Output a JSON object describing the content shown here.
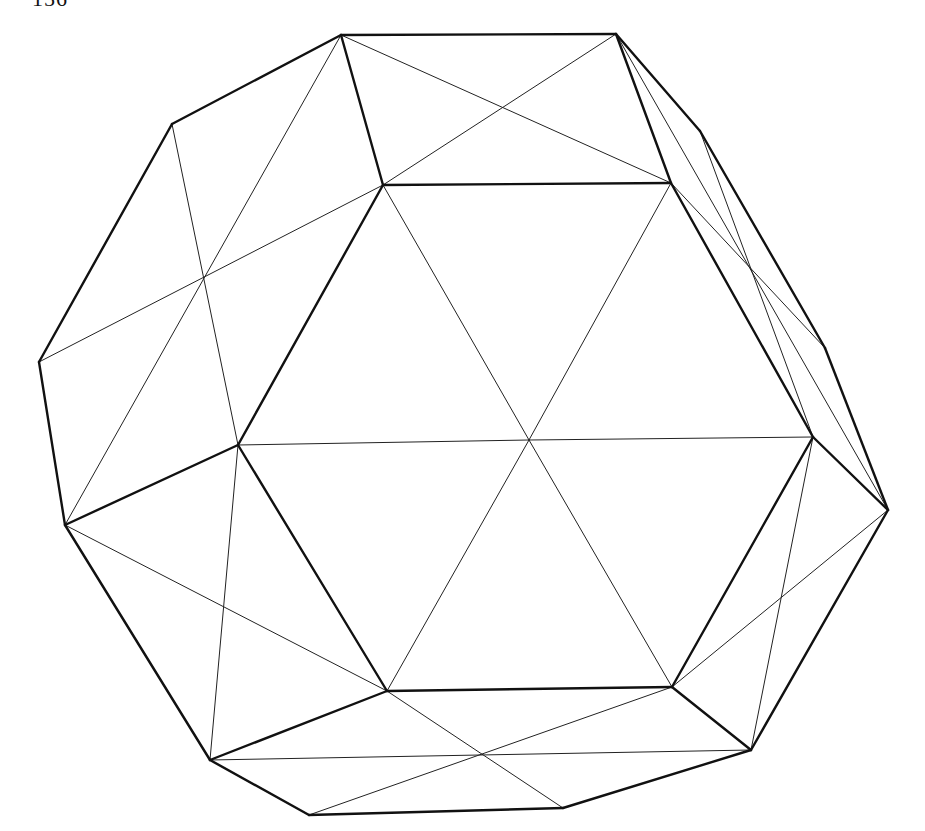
{
  "page": {
    "number": "156"
  },
  "figure": {
    "stroke_color": "#111111",
    "background": "#ffffff",
    "vertices": {
      "T1": [
        341,
        35
      ],
      "T2": [
        616,
        34
      ],
      "HTL": [
        383,
        185
      ],
      "HTR": [
        671,
        183
      ],
      "HR": [
        813,
        437
      ],
      "HBR": [
        672,
        687
      ],
      "HBL": [
        387,
        691
      ],
      "HL": [
        238,
        445
      ],
      "C": [
        529,
        440
      ],
      "O1": [
        172,
        124
      ],
      "X1": [
        203,
        279
      ],
      "O2": [
        39,
        362
      ],
      "O3": [
        65,
        525
      ],
      "R1": [
        700,
        131
      ],
      "R2": [
        750,
        267
      ],
      "R4": [
        825,
        348
      ],
      "R5": [
        888,
        510
      ],
      "B1": [
        210,
        760
      ],
      "B2": [
        481,
        755
      ],
      "B3": [
        309,
        815
      ],
      "B4": [
        563,
        808
      ],
      "B5": [
        751,
        750
      ]
    },
    "thick_edges": [
      [
        "T1",
        "T2"
      ],
      [
        "T1",
        "HTL"
      ],
      [
        "T2",
        "HTR"
      ],
      [
        "HTL",
        "HTR"
      ],
      [
        "HTR",
        "HR"
      ],
      [
        "HR",
        "HBR"
      ],
      [
        "HBR",
        "HBL"
      ],
      [
        "HBL",
        "HL"
      ],
      [
        "HL",
        "HTL"
      ],
      [
        "T1",
        "O1"
      ],
      [
        "O1",
        "O2"
      ],
      [
        "O2",
        "O3"
      ],
      [
        "O3",
        "HL"
      ],
      [
        "O3",
        "B1"
      ],
      [
        "B1",
        "HBL"
      ],
      [
        "B1",
        "B3"
      ],
      [
        "B3",
        "B4"
      ],
      [
        "B4",
        "B5"
      ],
      [
        "B5",
        "HBR"
      ],
      [
        "B5",
        "R5"
      ],
      [
        "R5",
        "HR"
      ],
      [
        "R5",
        "R4"
      ],
      [
        "R4",
        "R1"
      ],
      [
        "R1",
        "T2"
      ]
    ],
    "thin_edges": [
      [
        "C",
        "HTL"
      ],
      [
        "C",
        "HTR"
      ],
      [
        "C",
        "HR"
      ],
      [
        "C",
        "HBR"
      ],
      [
        "C",
        "HBL"
      ],
      [
        "C",
        "HL"
      ],
      [
        "T1",
        "HTR"
      ],
      [
        "T2",
        "HTL"
      ],
      [
        "T1",
        "O3"
      ],
      [
        "O1",
        "HL"
      ],
      [
        "O2",
        "HTL"
      ],
      [
        "O3",
        "HBL"
      ],
      [
        "HL",
        "B1"
      ],
      [
        "B1",
        "B5"
      ],
      [
        "HBL",
        "B4"
      ],
      [
        "B3",
        "HBR"
      ],
      [
        "HBR",
        "R5"
      ],
      [
        "HR",
        "B5"
      ],
      [
        "T2",
        "R5"
      ],
      [
        "HTR",
        "R4"
      ],
      [
        "R1",
        "HR"
      ]
    ]
  }
}
